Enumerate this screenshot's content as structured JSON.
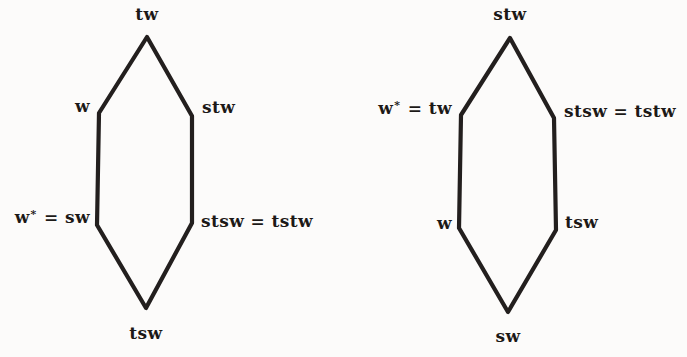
{
  "figure": {
    "background_color": "#fcfbfa",
    "stroke_color": "#231f1e",
    "type": "two-hexagon-weak-order-diagram"
  },
  "hexagons": [
    {
      "name": "left-hexagon",
      "points": "147,37 192,116 192,223 146,308 97,225 99,113",
      "labels": {
        "top": "tw",
        "upper_left": "w",
        "upper_right": "stw",
        "lower_left": "w* = sw",
        "lower_right": "stsw = tstw",
        "bottom": "tsw"
      }
    },
    {
      "name": "right-hexagon",
      "points": "510,38 554,118 556,230 508,312 459,228 461,115",
      "labels": {
        "top": "stw",
        "upper_left": "w* = tw",
        "upper_right": "stsw = tstw",
        "lower_left": "w",
        "lower_right": "tsw",
        "bottom": "sw"
      }
    }
  ]
}
